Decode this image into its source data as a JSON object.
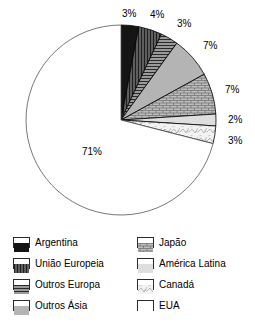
{
  "chart_data": {
    "type": "pie",
    "title": "",
    "xlabel": "",
    "ylabel": "",
    "legend_position": "bottom",
    "grid": false,
    "categories": [
      "Argentina",
      "União Europeia",
      "Outros Europa",
      "Outros Ásia",
      "Japão",
      "América Latina",
      "Canadá",
      "EUA"
    ],
    "values": [
      3,
      4,
      3,
      7,
      7,
      2,
      3,
      71
    ],
    "labels": [
      "3%",
      "4%",
      "3%",
      "7%",
      "7%",
      "2%",
      "3%",
      "71%"
    ],
    "slices": [
      {
        "name": "Argentina",
        "value": 3,
        "label": "3%",
        "fill": "#1a1a1a",
        "pattern": "solid-black",
        "outline": "#000000"
      },
      {
        "name": "União Europeia",
        "value": 4,
        "label": "4%",
        "fill": "#5e5e5e",
        "pattern": "vertical-lines",
        "outline": "#000000"
      },
      {
        "name": "Outros Europa",
        "value": 3,
        "label": "3%",
        "fill": "#8a8a8a",
        "pattern": "horizontal-lines",
        "outline": "#000000"
      },
      {
        "name": "Outros Ásia",
        "value": 7,
        "label": "7%",
        "fill": "#b0b0b0",
        "pattern": "solid-gray",
        "outline": "#000000"
      },
      {
        "name": "Japão",
        "value": 7,
        "label": "7%",
        "fill": "#b8b8b8",
        "pattern": "brick-texture",
        "outline": "#000000"
      },
      {
        "name": "América Latina",
        "value": 2,
        "label": "2%",
        "fill": "#dcdcdc",
        "pattern": "solid-light",
        "outline": "#000000"
      },
      {
        "name": "Canadá",
        "value": 3,
        "label": "3%",
        "fill": "#efefef",
        "pattern": "mottled",
        "outline": "#000000"
      },
      {
        "name": "EUA",
        "value": 71,
        "label": "71%",
        "fill": "#ffffff",
        "pattern": "none",
        "outline": "#555555"
      }
    ]
  },
  "chart": {
    "center_x": 121,
    "center_y": 120,
    "radius": 95,
    "start_angle_deg": 0,
    "direction": "clockwise",
    "pct_labels": [
      {
        "text": "3%",
        "x": 122,
        "y": 8,
        "for": "Argentina"
      },
      {
        "text": "4%",
        "x": 150,
        "y": 9,
        "for": "União Europeia"
      },
      {
        "text": "3%",
        "x": 177,
        "y": 18,
        "for": "Outros Europa"
      },
      {
        "text": "7%",
        "x": 203,
        "y": 40,
        "for": "Outros Ásia"
      },
      {
        "text": "7%",
        "x": 225,
        "y": 84,
        "for": "Japão"
      },
      {
        "text": "2%",
        "x": 228,
        "y": 114,
        "for": "América Latina"
      },
      {
        "text": "3%",
        "x": 228,
        "y": 135,
        "for": "Canadá"
      },
      {
        "text": "71%",
        "x": 82,
        "y": 146,
        "for": "EUA"
      }
    ]
  },
  "legend": {
    "columns": [
      {
        "items": [
          {
            "label": "Argentina",
            "swatch": "solid-black"
          },
          {
            "label": "União Europeia",
            "swatch": "vertical-lines"
          },
          {
            "label": "Outros Europa",
            "swatch": "horizontal-lines"
          },
          {
            "label": "Outros Ásia",
            "swatch": "solid-gray"
          }
        ]
      },
      {
        "items": [
          {
            "label": "Japão",
            "swatch": "brick-texture"
          },
          {
            "label": "América Latina",
            "swatch": "solid-light"
          },
          {
            "label": "Canadá",
            "swatch": "mottled"
          },
          {
            "label": "EUA",
            "swatch": "none"
          }
        ]
      }
    ]
  }
}
